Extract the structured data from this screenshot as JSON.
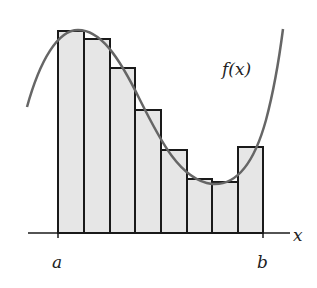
{
  "diagram": {
    "function_label": "f(x)",
    "axis_label": "x",
    "interval": {
      "start_label": "a",
      "end_label": "b"
    },
    "colors": {
      "rect_fill": "#e6e6e6",
      "rect_stroke": "#1a1a1a",
      "curve": "#666666",
      "axis": "#1a1a1a",
      "text": "#222222"
    },
    "axis": {
      "y": 233,
      "x_start": 28,
      "x_end": 290
    },
    "ticks": [
      {
        "x": 58,
        "label": "a"
      },
      {
        "x": 263,
        "label": "b"
      }
    ],
    "rectangles": [
      {
        "x0": 58,
        "x1": 84,
        "top": 31
      },
      {
        "x0": 84,
        "x1": 110,
        "top": 39
      },
      {
        "x0": 110,
        "x1": 135,
        "top": 68
      },
      {
        "x0": 135,
        "x1": 161,
        "top": 110
      },
      {
        "x0": 161,
        "x1": 187,
        "top": 150
      },
      {
        "x0": 187,
        "x1": 212,
        "top": 179
      },
      {
        "x0": 212,
        "x1": 238,
        "top": 182
      },
      {
        "x0": 238,
        "x1": 263,
        "top": 147
      }
    ],
    "curve_path": "M 27 107 C 40 60, 58 30, 78 30 C 100 30, 118 55, 140 100 C 160 140, 180 180, 212 184 C 238 186, 255 160, 266 120 C 274 90, 279 60, 283 29",
    "label_positions": {
      "function": {
        "x": 222,
        "y": 75
      },
      "axis": {
        "x": 293,
        "y": 241
      },
      "a": {
        "x": 52,
        "y": 268
      },
      "b": {
        "x": 257,
        "y": 268
      }
    }
  }
}
